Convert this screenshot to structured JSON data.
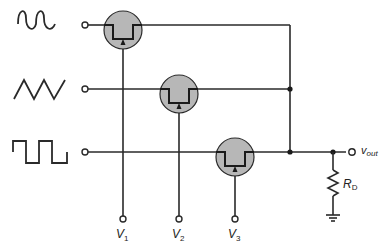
{
  "diagram": {
    "title": "",
    "type": "analog multiplexer (FET switches)",
    "inputs": [
      {
        "waveform": "sine",
        "label": ""
      },
      {
        "waveform": "triangle",
        "label": ""
      },
      {
        "waveform": "square",
        "label": ""
      }
    ],
    "controls": [
      {
        "label": "V",
        "sub": "1"
      },
      {
        "label": "V",
        "sub": "2"
      },
      {
        "label": "V",
        "sub": "3"
      }
    ],
    "output": {
      "label": "v",
      "sub": "out"
    },
    "load": {
      "label": "R",
      "sub": "D"
    },
    "colors": {
      "wire": "#2a2a2a",
      "fet_fill": "#b7b7b7",
      "background": "#ffffff"
    }
  }
}
